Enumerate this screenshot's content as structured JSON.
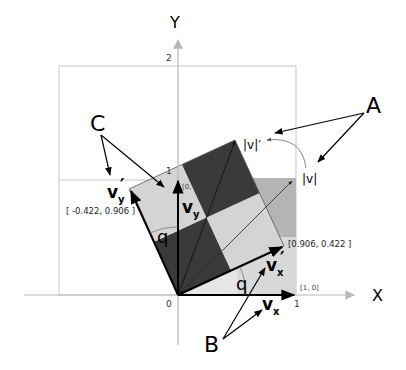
{
  "axes": {
    "x_label": "X",
    "y_label": "Y",
    "origin_label": "0",
    "x_tick_1": "1",
    "y_tick_1": "1",
    "y_tick_2": "2"
  },
  "points": {
    "unit_x": "[1, 0]",
    "unit_y": "[0, 1]",
    "rotated_x": "[0.906, 0.422 ]",
    "rotated_y": "[ -0.422, 0.906 ]"
  },
  "vectors": {
    "vx": {
      "main": "v",
      "sub": "x",
      "prime": ""
    },
    "vy": {
      "main": "v",
      "sub": "y",
      "prime": ""
    },
    "vx_prime": {
      "main": "v",
      "sub": "x",
      "prime": "′"
    },
    "vy_prime": {
      "main": "v",
      "sub": "y",
      "prime": "′"
    },
    "norm_v": "|v|",
    "norm_v_prime": "|v|′"
  },
  "angles": {
    "theta_x": "q",
    "theta_y": "q"
  },
  "callouts": {
    "A": "A",
    "B": "B",
    "C": "C"
  },
  "colors": {
    "axis": "#b8b8b8",
    "grid": "#c8c8c8",
    "dark_quad": "#3a3a3a",
    "light_quad": "#cfcfcf",
    "orig_square_light": "#e6e6e6",
    "orig_square_mid": "#b4b4b4"
  }
}
